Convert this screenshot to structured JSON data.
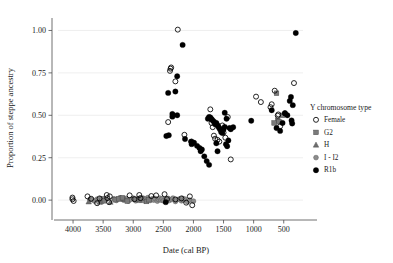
{
  "chart_data": {
    "type": "scatter",
    "title": "",
    "xlabel": "Date (cal BP)",
    "ylabel": "Proportion of steppe ancestry",
    "xlim": [
      4250,
      180
    ],
    "ylim": [
      -0.07,
      1.05
    ],
    "x_reversed": true,
    "xticks": [
      4000,
      3500,
      3000,
      2500,
      2000,
      1500,
      1000,
      500
    ],
    "xticklabels": [
      "4000",
      "3500",
      "3000",
      "2500",
      "2000",
      "1500",
      "1000",
      "500"
    ],
    "yticks": [
      0.0,
      0.25,
      0.5,
      0.75,
      1.0
    ],
    "yticklabels": [
      "0.00",
      "0.25",
      "0.50",
      "0.75",
      "1.00"
    ],
    "grid": "horizontal-major-only",
    "legend_position": "right",
    "legend_title": "Y chromosome type",
    "series": [
      {
        "name": "Female",
        "marker": "open-circle",
        "color": "#000000",
        "fill": "none",
        "points": [
          [
            4010,
            0.015
          ],
          [
            4010,
            0.005
          ],
          [
            3990,
            -0.005
          ],
          [
            3760,
            0.022
          ],
          [
            3700,
            0.008
          ],
          [
            3600,
            -0.018
          ],
          [
            3560,
            0.01
          ],
          [
            3440,
            0.03
          ],
          [
            3430,
            0.012
          ],
          [
            3400,
            -0.012
          ],
          [
            3390,
            0.022
          ],
          [
            3060,
            0.028
          ],
          [
            2980,
            0.006
          ],
          [
            2900,
            0.03
          ],
          [
            2880,
            0.012
          ],
          [
            2700,
            0.024
          ],
          [
            2620,
            0.028
          ],
          [
            2480,
            0.035
          ],
          [
            2440,
            0.006
          ],
          [
            2300,
            0.004
          ],
          [
            2200,
            0.01
          ],
          [
            2120,
            -0.015
          ],
          [
            2060,
            0.022
          ],
          [
            2020,
            -0.03
          ],
          [
            2260,
            1.005
          ],
          [
            2380,
            0.775
          ],
          [
            2390,
            0.762
          ],
          [
            2370,
            0.782
          ],
          [
            2300,
            0.7
          ],
          [
            2420,
            0.46
          ],
          [
            2150,
            0.385
          ],
          [
            1720,
            0.535
          ],
          [
            1700,
            0.455
          ],
          [
            1680,
            0.43
          ],
          [
            1660,
            0.38
          ],
          [
            1640,
            0.362
          ],
          [
            1600,
            0.355
          ],
          [
            1570,
            0.345
          ],
          [
            1540,
            0.418
          ],
          [
            1520,
            0.44
          ],
          [
            1500,
            0.398
          ],
          [
            1470,
            0.368
          ],
          [
            1430,
            0.49
          ],
          [
            1380,
            0.24
          ],
          [
            2030,
            0.345
          ],
          [
            960,
            0.61
          ],
          [
            880,
            0.578
          ],
          [
            650,
            0.645
          ],
          [
            600,
            0.498
          ],
          [
            590,
            0.505
          ],
          [
            560,
            0.435
          ],
          [
            700,
            0.565
          ],
          [
            720,
            0.548
          ],
          [
            330,
            0.69
          ],
          [
            480,
            0.512
          ]
        ]
      },
      {
        "name": "G2",
        "marker": "filled-square",
        "color": "#7a7a7a",
        "fill": "#7a7a7a",
        "points": [
          [
            3520,
            0.008
          ],
          [
            3480,
            -0.004
          ],
          [
            3300,
            0.002
          ],
          [
            3240,
            0.008
          ],
          [
            3180,
            0.014
          ],
          [
            3100,
            -0.006
          ],
          [
            2960,
            0.004
          ],
          [
            2860,
            0.01
          ],
          [
            2780,
            -0.008
          ],
          [
            2740,
            0.002
          ],
          [
            620,
            0.63
          ],
          [
            600,
            0.47
          ],
          [
            580,
            0.462
          ],
          [
            660,
            0.455
          ],
          [
            520,
            0.5
          ]
        ]
      },
      {
        "name": "H",
        "marker": "filled-triangle",
        "color": "#6e6e6e",
        "fill": "#6e6e6e",
        "points": [
          [
            3740,
            -0.01
          ],
          [
            3560,
            -0.012
          ],
          [
            3380,
            -0.012
          ],
          [
            3200,
            0.006
          ],
          [
            3140,
            0.004
          ],
          [
            2900,
            -0.002
          ]
        ]
      },
      {
        "name": "I - I2",
        "marker": "filled-circle-gray",
        "color": "#8c8c8c",
        "fill": "#8c8c8c",
        "points": [
          [
            3720,
            0.004
          ],
          [
            3680,
            0.002
          ],
          [
            3640,
            -0.006
          ],
          [
            3600,
            0.006
          ],
          [
            3520,
            -0.01
          ],
          [
            3460,
            0.004
          ],
          [
            3320,
            0.008
          ],
          [
            3280,
            -0.002
          ],
          [
            3220,
            0.014
          ],
          [
            3160,
            0.0
          ],
          [
            3120,
            0.01
          ],
          [
            3080,
            -0.006
          ],
          [
            3040,
            0.004
          ],
          [
            3000,
            0.012
          ],
          [
            2960,
            -0.004
          ],
          [
            2920,
            0.008
          ],
          [
            2880,
            0.0
          ],
          [
            2840,
            0.012
          ],
          [
            2820,
            -0.004
          ],
          [
            2800,
            0.006
          ],
          [
            2760,
            0.014
          ],
          [
            2720,
            -0.002
          ],
          [
            2680,
            0.008
          ],
          [
            2660,
            0.0
          ],
          [
            2640,
            0.01
          ],
          [
            2600,
            -0.006
          ],
          [
            2580,
            0.004
          ],
          [
            2560,
            0.012
          ],
          [
            2540,
            0.0
          ],
          [
            2520,
            0.008
          ],
          [
            2500,
            -0.004
          ],
          [
            2460,
            0.006
          ],
          [
            2420,
            0.01
          ],
          [
            2400,
            -0.002
          ],
          [
            2360,
            0.004
          ],
          [
            2340,
            0.012
          ],
          [
            2300,
            -0.008
          ],
          [
            2280,
            0.002
          ],
          [
            2240,
            0.006
          ],
          [
            2200,
            -0.004
          ],
          [
            2180,
            0.01
          ],
          [
            2160,
            0.0
          ],
          [
            2140,
            0.006
          ],
          [
            2100,
            -0.01
          ],
          [
            2060,
            0.0
          ],
          [
            2000,
            -0.006
          ]
        ]
      },
      {
        "name": "R1b",
        "marker": "filled-circle",
        "color": "#000000",
        "fill": "#000000",
        "points": [
          [
            2460,
            -0.012
          ],
          [
            2180,
            0.915
          ],
          [
            2270,
            0.73
          ],
          [
            2420,
            0.632
          ],
          [
            2300,
            0.64
          ],
          [
            2350,
            0.508
          ],
          [
            2350,
            0.492
          ],
          [
            2270,
            0.5
          ],
          [
            2450,
            0.378
          ],
          [
            2410,
            0.382
          ],
          [
            2140,
            0.36
          ],
          [
            2040,
            0.345
          ],
          [
            2030,
            0.33
          ],
          [
            1990,
            0.338
          ],
          [
            1940,
            0.32
          ],
          [
            1900,
            0.308
          ],
          [
            1880,
            0.288
          ],
          [
            1860,
            0.298
          ],
          [
            1820,
            0.258
          ],
          [
            1780,
            0.23
          ],
          [
            1740,
            0.208
          ],
          [
            1760,
            0.48
          ],
          [
            1740,
            0.49
          ],
          [
            1720,
            0.488
          ],
          [
            1700,
            0.478
          ],
          [
            1680,
            0.47
          ],
          [
            1660,
            0.462
          ],
          [
            1640,
            0.448
          ],
          [
            1620,
            0.455
          ],
          [
            1600,
            0.442
          ],
          [
            1580,
            0.43
          ],
          [
            1560,
            0.418
          ],
          [
            1540,
            0.402
          ],
          [
            1520,
            0.395
          ],
          [
            1500,
            0.418
          ],
          [
            1480,
            0.432
          ],
          [
            1460,
            0.33
          ],
          [
            1440,
            0.318
          ],
          [
            1420,
            0.352
          ],
          [
            1400,
            0.425
          ],
          [
            1380,
            0.418
          ],
          [
            1340,
            0.43
          ],
          [
            1480,
            0.515
          ],
          [
            1450,
            0.48
          ],
          [
            1620,
            0.335
          ],
          [
            1600,
            0.288
          ],
          [
            1040,
            0.468
          ],
          [
            700,
            0.53
          ],
          [
            620,
            0.425
          ],
          [
            560,
            0.408
          ],
          [
            520,
            0.455
          ],
          [
            480,
            0.512
          ],
          [
            440,
            0.5
          ],
          [
            400,
            0.585
          ],
          [
            380,
            0.608
          ],
          [
            350,
            0.56
          ],
          [
            370,
            0.47
          ],
          [
            360,
            0.452
          ],
          [
            300,
            0.985
          ]
        ]
      }
    ]
  },
  "legend": {
    "title": "Y chromosome type",
    "items": [
      {
        "label": "Female",
        "marker": "open-circle"
      },
      {
        "label": "G2",
        "marker": "filled-square"
      },
      {
        "label": "H",
        "marker": "filled-triangle"
      },
      {
        "label": "I - I2",
        "marker": "filled-circle-gray"
      },
      {
        "label": "R1b",
        "marker": "filled-circle"
      }
    ]
  },
  "axes": {
    "x_title": "Date (cal BP)",
    "y_title": "Proportion of steppe ancestry"
  },
  "colors": {
    "grid": "#ebebeb",
    "axis": "#4d4d4d",
    "text": "#1a1a1a",
    "r1b": "#000000",
    "g2": "#7a7a7a",
    "h": "#6e6e6e",
    "i_i2": "#8c8c8c"
  }
}
